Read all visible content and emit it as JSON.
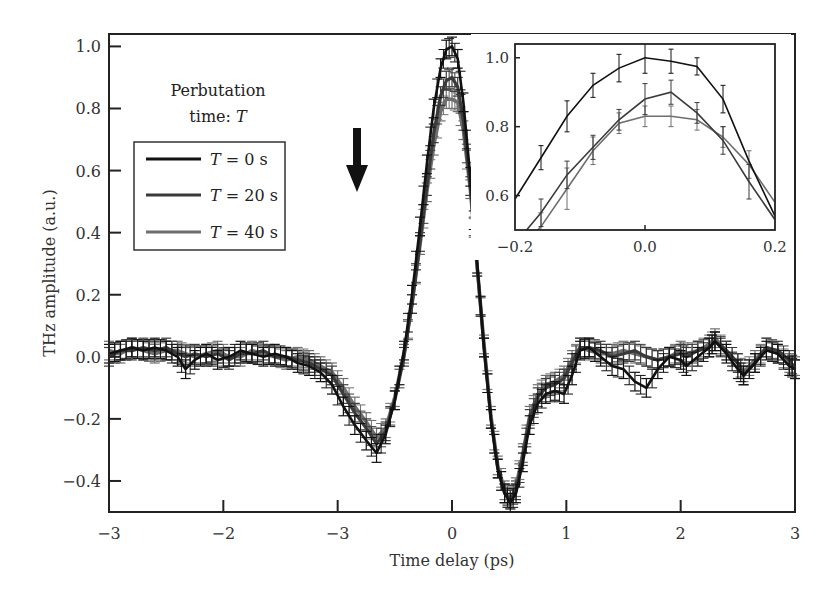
{
  "chart_data": {
    "type": "line",
    "title": "",
    "xlabel": "Time delay (ps)",
    "ylabel": "THz amplitude (a.u.)",
    "xlim": [
      -3,
      3
    ],
    "ylim": [
      -0.5,
      1.04
    ],
    "x_ticks": [
      -3,
      -2,
      -1,
      0,
      1,
      2,
      3
    ],
    "x_tick_labels": [
      "−3",
      "−2",
      "−3",
      "0",
      "1",
      "2",
      "3"
    ],
    "y_ticks": [
      1.0,
      0.8,
      0.6,
      0.4,
      0.2,
      0.0,
      -0.2,
      -0.4
    ],
    "y_tick_labels": [
      "1.0",
      "0.8",
      "0.6",
      "0.4",
      "0.2",
      "0.0",
      "−0.2",
      "−0.4"
    ],
    "grid": false,
    "annotation": {
      "line1": "Perbutation",
      "line2_prefix": "time: ",
      "line2_var": "T",
      "arrow": "down-arrow"
    },
    "legend": {
      "placement": "top-left",
      "entries": [
        {
          "var": "T",
          "text": " = 0 s"
        },
        {
          "var": "T",
          "text": " = 20 s"
        },
        {
          "var": "T",
          "text": " = 40 s"
        }
      ]
    },
    "x": [
      -3.0,
      -2.9,
      -2.8,
      -2.7,
      -2.6,
      -2.5,
      -2.4,
      -2.33,
      -2.25,
      -2.15,
      -2.05,
      -1.95,
      -1.85,
      -1.75,
      -1.65,
      -1.55,
      -1.45,
      -1.35,
      -1.25,
      -1.15,
      -1.05,
      -0.95,
      -0.85,
      -0.75,
      -0.66,
      -0.58,
      -0.5,
      -0.42,
      -0.35,
      -0.28,
      -0.22,
      -0.16,
      -0.1,
      -0.05,
      0.0,
      0.05,
      0.1,
      0.16,
      0.22,
      0.28,
      0.34,
      0.4,
      0.46,
      0.51,
      0.56,
      0.62,
      0.68,
      0.75,
      0.82,
      0.9,
      0.98,
      1.05,
      1.12,
      1.2,
      1.3,
      1.4,
      1.5,
      1.6,
      1.7,
      1.8,
      1.9,
      2.0,
      2.05,
      2.15,
      2.25,
      2.3,
      2.4,
      2.5,
      2.55,
      2.65,
      2.75,
      2.85,
      2.95,
      3.0
    ],
    "series": [
      {
        "name": "T = 0 s",
        "color": "#111111",
        "error": 0.03,
        "values": [
          0.01,
          0.02,
          0.03,
          0.02,
          0.03,
          0.02,
          0.0,
          -0.04,
          -0.01,
          0.01,
          -0.01,
          0.0,
          0.02,
          0.01,
          0.0,
          0.01,
          0.0,
          -0.02,
          -0.03,
          -0.05,
          -0.09,
          -0.16,
          -0.22,
          -0.27,
          -0.31,
          -0.25,
          -0.14,
          0.02,
          0.2,
          0.42,
          0.62,
          0.8,
          0.93,
          0.99,
          1.0,
          0.96,
          0.82,
          0.58,
          0.3,
          0.03,
          -0.2,
          -0.36,
          -0.44,
          -0.47,
          -0.44,
          -0.34,
          -0.22,
          -0.15,
          -0.12,
          -0.11,
          -0.12,
          -0.06,
          0.02,
          0.03,
          0.0,
          -0.03,
          -0.04,
          -0.08,
          -0.1,
          -0.04,
          0.0,
          -0.01,
          -0.03,
          0.0,
          0.03,
          0.05,
          0.01,
          -0.04,
          -0.06,
          -0.02,
          0.02,
          0.01,
          -0.03,
          -0.04
        ]
      },
      {
        "name": "T = 20 s",
        "color": "#3a3a3a",
        "error": 0.03,
        "values": [
          0.0,
          0.02,
          0.02,
          0.03,
          0.02,
          0.03,
          0.01,
          0.0,
          0.01,
          0.0,
          0.01,
          -0.01,
          0.01,
          0.01,
          0.02,
          0.0,
          0.0,
          -0.01,
          -0.02,
          -0.04,
          -0.06,
          -0.12,
          -0.18,
          -0.23,
          -0.28,
          -0.24,
          -0.14,
          0.0,
          0.17,
          0.37,
          0.55,
          0.72,
          0.84,
          0.89,
          0.9,
          0.87,
          0.76,
          0.55,
          0.29,
          0.03,
          -0.2,
          -0.36,
          -0.44,
          -0.46,
          -0.43,
          -0.32,
          -0.2,
          -0.13,
          -0.1,
          -0.09,
          -0.07,
          -0.02,
          0.03,
          0.03,
          0.02,
          0.0,
          0.01,
          0.02,
          0.0,
          -0.01,
          0.0,
          0.01,
          0.0,
          0.02,
          0.03,
          0.05,
          0.02,
          -0.02,
          -0.06,
          -0.02,
          0.03,
          0.02,
          -0.01,
          -0.04
        ]
      },
      {
        "name": "T = 40 s",
        "color": "#6e6e6e",
        "error": 0.03,
        "values": [
          0.02,
          0.01,
          0.03,
          0.02,
          0.01,
          0.02,
          0.02,
          0.01,
          0.0,
          0.01,
          0.02,
          0.0,
          0.0,
          0.02,
          0.01,
          0.0,
          -0.01,
          0.0,
          -0.01,
          -0.03,
          -0.05,
          -0.1,
          -0.16,
          -0.21,
          -0.26,
          -0.23,
          -0.13,
          0.01,
          0.17,
          0.36,
          0.53,
          0.68,
          0.79,
          0.83,
          0.83,
          0.82,
          0.73,
          0.54,
          0.29,
          0.04,
          -0.19,
          -0.35,
          -0.43,
          -0.46,
          -0.42,
          -0.31,
          -0.19,
          -0.12,
          -0.09,
          -0.08,
          -0.06,
          -0.01,
          0.03,
          0.02,
          0.01,
          0.01,
          0.02,
          0.01,
          0.0,
          -0.01,
          0.0,
          0.02,
          0.01,
          0.02,
          0.04,
          0.06,
          0.02,
          -0.02,
          -0.05,
          -0.01,
          0.03,
          0.01,
          -0.02,
          -0.03
        ]
      }
    ],
    "inset": {
      "type": "line",
      "xlim": [
        -0.2,
        0.2
      ],
      "ylim": [
        0.5,
        1.04
      ],
      "x_ticks": [
        -0.2,
        0.0,
        0.2
      ],
      "x_tick_labels": [
        "−0.2",
        "0.0",
        "0.2"
      ],
      "y_ticks": [
        1.0,
        0.8,
        0.6
      ],
      "y_tick_labels": [
        "1.0",
        "0.8",
        "0.6"
      ],
      "x": [
        -0.2,
        -0.16,
        -0.12,
        -0.08,
        -0.04,
        0.0,
        0.04,
        0.08,
        0.12,
        0.16,
        0.2
      ],
      "series": [
        {
          "name": "T = 0 s",
          "color": "#111111",
          "values": [
            0.59,
            0.71,
            0.83,
            0.92,
            0.97,
            1.0,
            0.99,
            0.975,
            0.88,
            0.7,
            0.54
          ],
          "errors": [
            0.0,
            0.035,
            0.045,
            0.035,
            0.04,
            0.045,
            0.035,
            0.025,
            0.04,
            0.0,
            0.0
          ]
        },
        {
          "name": "T = 20 s",
          "color": "#3a3a3a",
          "values": [
            0.46,
            0.55,
            0.66,
            0.74,
            0.82,
            0.88,
            0.9,
            0.84,
            0.76,
            0.64,
            0.53
          ],
          "errors": [
            0.0,
            0.04,
            0.04,
            0.035,
            0.03,
            0.045,
            0.035,
            0.03,
            0.04,
            0.05,
            0.0
          ]
        },
        {
          "name": "T = 40 s",
          "color": "#6e6e6e",
          "values": [
            0.43,
            0.51,
            0.62,
            0.73,
            0.81,
            0.83,
            0.83,
            0.82,
            0.77,
            0.69,
            0.58
          ],
          "errors": [
            0.0,
            0.04,
            0.06,
            0.04,
            0.03,
            0.03,
            0.03,
            0.03,
            0.03,
            0.04,
            0.0
          ]
        }
      ]
    }
  }
}
